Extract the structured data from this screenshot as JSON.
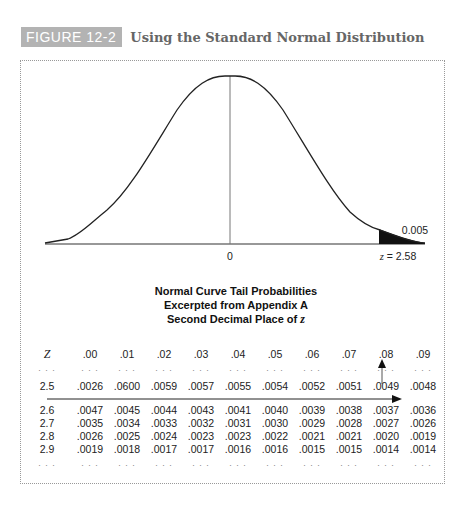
{
  "figure": {
    "label": "FIGURE 12-2",
    "title": "Using the Standard Normal Distribution"
  },
  "curve": {
    "center_label": "0",
    "z_label": "z = 2.58",
    "tail_label": "0.005"
  },
  "table": {
    "title_lines": [
      "Normal Curve Tail Probabilities",
      "Excerpted from Appendix A",
      "Second Decimal Place of "
    ],
    "title_italic": "z",
    "z_header": "Z",
    "columns": [
      ".00",
      ".01",
      ".02",
      ".03",
      ".04",
      ".05",
      ".06",
      ".07",
      ".08",
      ".09"
    ],
    "ellipsis": ". . .",
    "rows": [
      {
        "z": "2.5",
        "values": [
          ".0026",
          ".0600",
          ".0059",
          ".0057",
          ".0055",
          ".0054",
          ".0052",
          ".0051",
          ".0049",
          ".0048"
        ]
      },
      {
        "z": "2.6",
        "values": [
          ".0047",
          ".0045",
          ".0044",
          ".0043",
          ".0041",
          ".0040",
          ".0039",
          ".0038",
          ".0037",
          ".0036"
        ]
      },
      {
        "z": "2.7",
        "values": [
          ".0035",
          ".0034",
          ".0033",
          ".0032",
          ".0031",
          ".0030",
          ".0029",
          ".0028",
          ".0027",
          ".0026"
        ]
      },
      {
        "z": "2.8",
        "values": [
          ".0026",
          ".0025",
          ".0024",
          ".0023",
          ".0023",
          ".0022",
          ".0021",
          ".0021",
          ".0020",
          ".0019"
        ]
      },
      {
        "z": "2.9",
        "values": [
          ".0019",
          ".0018",
          ".0017",
          ".0017",
          ".0016",
          ".0016",
          ".0015",
          ".0015",
          ".0014",
          ".0014"
        ]
      }
    ]
  },
  "chart_data": {
    "type": "table",
    "figure_label": "FIGURE 12-2",
    "figure_title": "Using the Standard Normal Distribution",
    "curve": {
      "type": "area",
      "distribution": "standard normal",
      "mean": 0,
      "shaded_tail_from_z": 2.58,
      "shaded_tail_probability": 0.005,
      "x_labels": [
        "0",
        "z = 2.58"
      ]
    },
    "columns": [
      "Z",
      ".00",
      ".01",
      ".02",
      ".03",
      ".04",
      ".05",
      ".06",
      ".07",
      ".08",
      ".09"
    ],
    "rows": [
      [
        "2.5",
        ".0026",
        ".0600",
        ".0059",
        ".0057",
        ".0055",
        ".0054",
        ".0052",
        ".0051",
        ".0049",
        ".0048"
      ],
      [
        "2.6",
        ".0047",
        ".0045",
        ".0044",
        ".0043",
        ".0041",
        ".0040",
        ".0039",
        ".0038",
        ".0037",
        ".0036"
      ],
      [
        "2.7",
        ".0035",
        ".0034",
        ".0033",
        ".0032",
        ".0031",
        ".0030",
        ".0029",
        ".0028",
        ".0027",
        ".0026"
      ],
      [
        "2.8",
        ".0026",
        ".0025",
        ".0024",
        ".0023",
        ".0023",
        ".0022",
        ".0021",
        ".0021",
        ".0020",
        ".0019"
      ],
      [
        "2.9",
        ".0019",
        ".0018",
        ".0017",
        ".0017",
        ".0016",
        ".0016",
        ".0015",
        ".0015",
        ".0014",
        ".0014"
      ]
    ],
    "annotations": [
      "Horizontal arrow along row 2.5 to column .09 boundary",
      "Vertical arrow from .0049 up to column .08 header"
    ]
  }
}
